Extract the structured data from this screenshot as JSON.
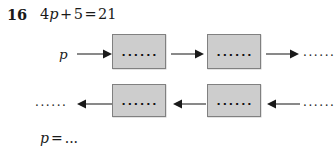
{
  "question": {
    "number": "16",
    "equation": "4p + 5 = 21",
    "equation_parts": {
      "coefficient": "4",
      "variable": "p",
      "plus": "+",
      "constant": "5",
      "equals": "=",
      "result": "21"
    }
  },
  "diagram": {
    "type": "function-machine-flowchart",
    "box_fill_color": "#cdcdcd",
    "box_border_color": "#808080",
    "box_content_placeholder": "......",
    "rows": [
      {
        "id": "top",
        "direction": "left-to-right",
        "start_label": "p",
        "boxes": [
          {
            "label": "......"
          },
          {
            "label": "......"
          }
        ],
        "end_label": "......"
      },
      {
        "id": "bottom",
        "direction": "right-to-left",
        "start_label": "......",
        "boxes": [
          {
            "label": "......"
          },
          {
            "label": "......"
          }
        ],
        "end_label": "......"
      }
    ]
  },
  "answer": {
    "variable": "p",
    "equals": "=",
    "value_placeholder": "..."
  }
}
